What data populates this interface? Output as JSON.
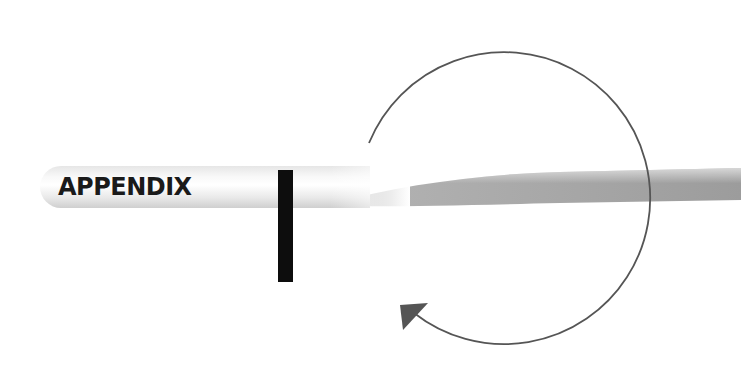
{
  "diagram": {
    "title": "APPENDIX",
    "elements": [
      {
        "type": "banner",
        "label": "APPENDIX"
      },
      {
        "type": "vertical-bar",
        "color": "#0d0d0d"
      },
      {
        "type": "circular-arrow",
        "direction": "clockwise",
        "stroke": "#555555"
      }
    ],
    "colors": {
      "banner_gray": "#9a9a9a",
      "bar": "#0d0d0d",
      "arrow": "#555555",
      "background": "#ffffff"
    }
  }
}
